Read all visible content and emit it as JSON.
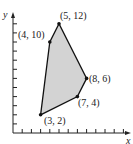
{
  "chart_data": {
    "type": "scatter",
    "title": "",
    "xlabel": "x",
    "ylabel": "y",
    "xlim": [
      0,
      13
    ],
    "ylim": [
      0,
      12
    ],
    "grid": false,
    "shaded_region": true,
    "fill_color": "#d3d3d3",
    "line_color": "#111111",
    "vertices": [
      {
        "x": 3,
        "y": 2,
        "label": "(3, 2)"
      },
      {
        "x": 7,
        "y": 4,
        "label": "(7, 4)"
      },
      {
        "x": 8,
        "y": 6,
        "label": "(8, 6)"
      },
      {
        "x": 5,
        "y": 12,
        "label": "(5, 12)"
      },
      {
        "x": 4,
        "y": 10,
        "label": "(4, 10)"
      }
    ]
  },
  "labels": {
    "p1": "(3, 2)",
    "p2": "(7, 4)",
    "p3": "(8, 6)",
    "p4": "(5, 12)",
    "p5": "(4, 10)",
    "x_axis": "x",
    "y_axis": "y"
  }
}
